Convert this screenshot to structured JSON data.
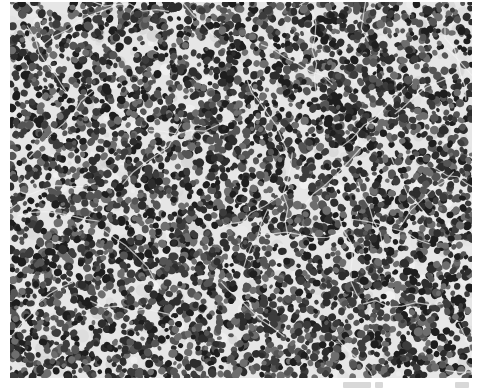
{
  "image": {
    "kind": "grayscale histology micrograph",
    "description": "Densely packed dark round cell nuclei on a pale background with thin light fibrous strands crossing the field",
    "background_color": "#e6e6e6",
    "nucleus_colors": [
      "#1e1e1e",
      "#2d2d2d",
      "#3c3c3c",
      "#555555",
      "#6e6e6e"
    ],
    "fiber_color": "#f2f2f2",
    "nucleus_count": 5200,
    "seed": 1337
  },
  "caption": {
    "text_legible": false
  }
}
